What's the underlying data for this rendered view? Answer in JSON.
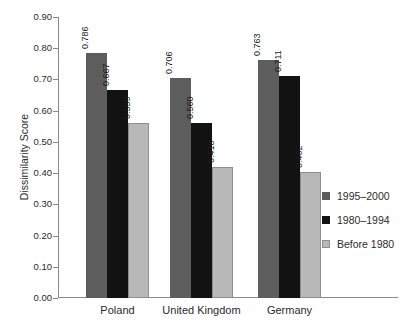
{
  "chart_data": {
    "type": "bar",
    "title": "",
    "ylabel": "Dissimilarity Score",
    "categories": [
      "Poland",
      "United Kingdom",
      "Germany"
    ],
    "series": [
      {
        "name": "1995–2000",
        "color": "#5d5d5d",
        "values": [
          0.786,
          0.706,
          0.763
        ]
      },
      {
        "name": "1980–1994",
        "color": "#121212",
        "values": [
          0.667,
          0.56,
          0.711
        ]
      },
      {
        "name": "Before 1980",
        "color": "#b8b8b8",
        "swatch_border": "#8f8f8f",
        "values": [
          0.559,
          0.418,
          0.402
        ]
      }
    ],
    "ylim": [
      0,
      0.9
    ],
    "ytick_step": 0.1,
    "ytick_format_decimals": 2,
    "value_label_decimals": 3,
    "value_labels_shown": true,
    "legend_position": "right",
    "grid": false
  }
}
